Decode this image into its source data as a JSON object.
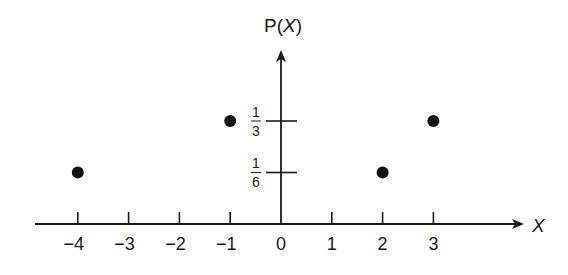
{
  "chart_data": {
    "type": "scatter",
    "title": "",
    "xlabel": "X",
    "ylabel": "P(X)",
    "x_ticks": [
      -4,
      -3,
      -2,
      -1,
      0,
      1,
      2,
      3
    ],
    "x_tick_labels": [
      "−4",
      "−3",
      "−2",
      "−1",
      "0",
      "1",
      "2",
      "3"
    ],
    "y_ticks": [
      {
        "value": 0.1667,
        "num": "1",
        "den": "6"
      },
      {
        "value": 0.3333,
        "num": "1",
        "den": "3"
      }
    ],
    "points": [
      {
        "x": -4,
        "y": 0.1667,
        "label": "1/6"
      },
      {
        "x": -1,
        "y": 0.3333,
        "label": "1/3"
      },
      {
        "x": 2,
        "y": 0.1667,
        "label": "1/6"
      },
      {
        "x": 3,
        "y": 0.3333,
        "label": "1/3"
      }
    ],
    "xlim": [
      -4.8,
      4.8
    ],
    "grid": false,
    "legend": null
  },
  "axes": {
    "y_label_prefix": "P(",
    "y_label_var": "X",
    "y_label_suffix": ")",
    "x_label": "X"
  }
}
